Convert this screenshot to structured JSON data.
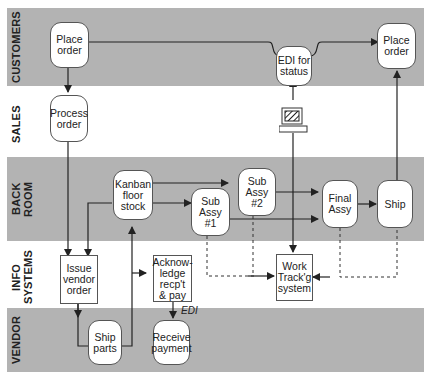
{
  "lanes": [
    {
      "id": "customers",
      "label": "CUSTOMERS",
      "shaded": true
    },
    {
      "id": "sales",
      "label": "SALES",
      "shaded": false
    },
    {
      "id": "back_room",
      "label": "BACK\nROOM",
      "shaded": true
    },
    {
      "id": "info_systems",
      "label": "INFO\nSYSTEMS",
      "shaded": false
    },
    {
      "id": "vendor",
      "label": "VENDOR",
      "shaded": true
    }
  ],
  "nodes": {
    "place_order_1": "Place\norder",
    "edi_for_status": "EDI for\nstatus",
    "place_order_2": "Place\norder",
    "process_order": "Process\norder",
    "kanban_floor_stock": "Kanban\nfloor\nstock",
    "sub_assy_1": "Sub\nAssy\n#1",
    "sub_assy_2": "Sub\nAssy\n#2",
    "final_assy": "Final\nAssy",
    "ship": "Ship",
    "issue_vendor_order": "Issue\nvendor\norder",
    "acknowledge": "Acknow-\nledge\nrecp't\n& pay",
    "work_tracking": "Work\nTrack'g\nsystem",
    "ship_parts": "Ship\nparts",
    "receive_payment": "Receive\npayment"
  },
  "annotations": {
    "edi_label": "EDI"
  },
  "icons": {
    "terminal": "computer-terminal-icon"
  },
  "colors": {
    "band": "#b3b3b3",
    "line": "#222222",
    "node_fill": "#ffffff"
  }
}
